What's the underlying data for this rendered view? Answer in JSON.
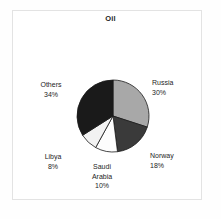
{
  "chart": {
    "title": "Oil",
    "background_color": "#ffffff",
    "frame_color": "#e3e3e3",
    "text_color": "#1d1d1d"
  },
  "chart_data": {
    "type": "pie",
    "title": "Oil",
    "xlabel": "",
    "ylabel": "",
    "legend_position": "none",
    "grid": false,
    "start_angle_deg": 90,
    "direction": "clockwise",
    "categories": [
      "Russia",
      "Norway",
      "Saudi Arabia",
      "Libya",
      "Others"
    ],
    "values": [
      30,
      18,
      10,
      8,
      34
    ],
    "units": "percent",
    "colors": [
      "#a8a8a8",
      "#3a3a3a",
      "#fdfdfd",
      "#f2f2f2",
      "#1a1a1a"
    ],
    "slices": [
      {
        "label": "Russia",
        "value": 30,
        "display": "30%",
        "color": "#a8a8a8"
      },
      {
        "label": "Norway",
        "value": 18,
        "display": "18%",
        "color": "#3a3a3a"
      },
      {
        "label": "Saudi Arabia",
        "value": 10,
        "display": "10%",
        "color": "#fdfdfd"
      },
      {
        "label": "Libya",
        "value": 8,
        "display": "8%",
        "color": "#f2f2f2"
      },
      {
        "label": "Others",
        "value": 34,
        "display": "34%",
        "color": "#1a1a1a"
      }
    ]
  },
  "labels": {
    "russia": {
      "name": "Russia",
      "percent": "30%"
    },
    "norway": {
      "name": "Norway",
      "percent": "18%"
    },
    "saudi": {
      "name": "Saudi Arabia",
      "percent": "10%"
    },
    "libya": {
      "name": "Libya",
      "percent": "8%"
    },
    "others": {
      "name": "Others",
      "percent": "34%"
    }
  }
}
